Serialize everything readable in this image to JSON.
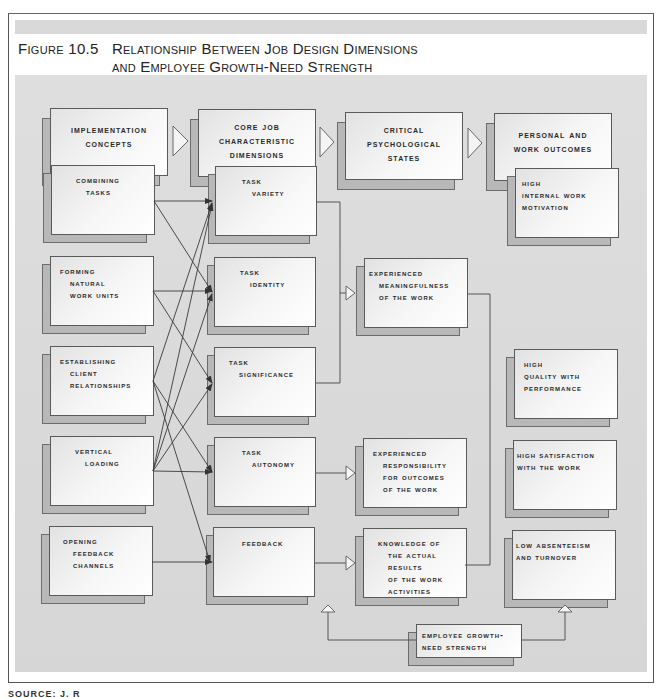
{
  "figure": {
    "number": "Figure 10.5",
    "title_lines": [
      "Relationship Between Job Design Dimensions",
      "and Employee Growth-Need Strength"
    ]
  },
  "headers": [
    {
      "id": "implementation",
      "lines": [
        "Implementation",
        "Concepts"
      ]
    },
    {
      "id": "core",
      "lines": [
        "Core Job",
        "Characteristic",
        "Dimensions"
      ]
    },
    {
      "id": "critical",
      "lines": [
        "Critical",
        "Psychological",
        "States"
      ]
    },
    {
      "id": "outcomes",
      "lines": [
        "Personal and",
        "Work Outcomes"
      ]
    }
  ],
  "implementation_concepts": [
    {
      "lines": [
        "Combining",
        "tasks"
      ]
    },
    {
      "lines": [
        "Forming",
        "natural",
        "work units"
      ]
    },
    {
      "lines": [
        "Establishing",
        "client",
        "relationships"
      ]
    },
    {
      "lines": [
        "Vertical",
        "loading"
      ]
    },
    {
      "lines": [
        "Opening",
        "feedback",
        "channels"
      ]
    }
  ],
  "core_dimensions": [
    {
      "lines": [
        "Task",
        "variety"
      ]
    },
    {
      "lines": [
        "Task",
        "identity"
      ]
    },
    {
      "lines": [
        "Task",
        "significance"
      ]
    },
    {
      "lines": [
        "Task",
        "autonomy"
      ]
    },
    {
      "lines": [
        "Feedback"
      ]
    }
  ],
  "psychological_states": [
    {
      "lines": [
        "Experienced",
        "meaningfulness",
        "of the work"
      ]
    },
    {
      "lines": [
        "Experienced",
        "responsibility",
        "for outcomes",
        "of the work"
      ]
    },
    {
      "lines": [
        "Knowledge of",
        "the actual",
        "results",
        "of the work",
        "activities"
      ]
    }
  ],
  "outcomes": [
    {
      "lines": [
        "High",
        "Internal Work",
        "Motivation"
      ]
    },
    {
      "lines": [
        "High",
        "Quality with",
        "Performance"
      ]
    },
    {
      "lines": [
        "High Satisfaction",
        "with the Work"
      ]
    },
    {
      "lines": [
        "Low Absenteeism",
        "and Turnover"
      ]
    }
  ],
  "moderator": {
    "lines": [
      "Employee Growth-",
      "Need Strength"
    ]
  },
  "connections": [
    {
      "from": "Combining tasks",
      "to": [
        "Task variety",
        "Task identity"
      ]
    },
    {
      "from": "Forming natural work units",
      "to": [
        "Task identity",
        "Task significance"
      ]
    },
    {
      "from": "Establishing client relationships",
      "to": [
        "Task variety",
        "Task autonomy",
        "Feedback"
      ]
    },
    {
      "from": "Vertical loading",
      "to": [
        "Task variety",
        "Task identity",
        "Task significance",
        "Task autonomy"
      ]
    },
    {
      "from": "Opening feedback channels",
      "to": [
        "Feedback"
      ]
    },
    {
      "from": "Task variety, Task identity, Task significance",
      "to": [
        "Experienced meaningfulness of the work"
      ]
    },
    {
      "from": "Task autonomy",
      "to": [
        "Experienced responsibility for outcomes of the work"
      ]
    },
    {
      "from": "Feedback",
      "to": [
        "Knowledge of the actual results of the work activities"
      ]
    },
    {
      "from": "Employee Growth-Need Strength",
      "to": [
        "Critical psychological states",
        "Personal and work outcomes"
      ]
    }
  ],
  "colors": {
    "panel": "#d9d9d9",
    "band": "#d9d9d9",
    "card_shadow": "#b8b8b8",
    "card_face": "#f4f4f4",
    "line": "#444444"
  },
  "source": {
    "text": "SOURCE: J. R"
  }
}
